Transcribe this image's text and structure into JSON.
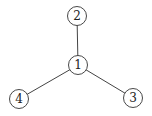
{
  "diagram": {
    "type": "tree",
    "style": {
      "edge_color": "#444444",
      "node_stroke": "#333333",
      "node_fill": "#ffffff",
      "label_color": "#222222"
    },
    "nodes": [
      {
        "id": "1",
        "label": "1",
        "x": 78,
        "y": 65,
        "r": 9.5
      },
      {
        "id": "2",
        "label": "2",
        "x": 77,
        "y": 16,
        "r": 9.5
      },
      {
        "id": "3",
        "label": "3",
        "x": 133,
        "y": 98,
        "r": 9.5
      },
      {
        "id": "4",
        "label": "4",
        "x": 19,
        "y": 99,
        "r": 9.5
      }
    ],
    "edges": [
      {
        "from": "1",
        "to": "2"
      },
      {
        "from": "1",
        "to": "3"
      },
      {
        "from": "1",
        "to": "4"
      }
    ]
  }
}
